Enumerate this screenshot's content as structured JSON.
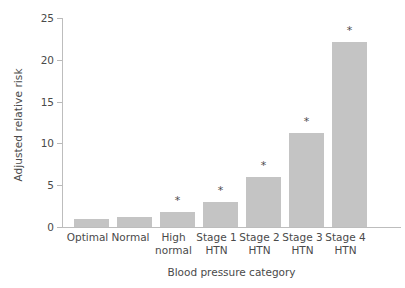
{
  "chart_data": {
    "type": "bar",
    "title": "",
    "subtitle": "",
    "xlabel": "Blood pressure category",
    "ylabel": "Adjusted relative risk",
    "categories": [
      "Optimal",
      "Normal",
      "High normal",
      "Stage 1 HTN",
      "Stage 2 HTN",
      "Stage 3 HTN",
      "Stage 4 HTN"
    ],
    "category_lines": [
      [
        "Optimal"
      ],
      [
        "Normal"
      ],
      [
        "High",
        "normal"
      ],
      [
        "Stage 1",
        "HTN"
      ],
      [
        "Stage 2",
        "HTN"
      ],
      [
        "Stage 3",
        "HTN"
      ],
      [
        "Stage 4",
        "HTN"
      ]
    ],
    "values": [
      1.0,
      1.2,
      1.8,
      3.0,
      6.0,
      11.2,
      22.1
    ],
    "annotations": [
      "",
      "",
      "*",
      "*",
      "*",
      "*",
      "*"
    ],
    "significance_marker": "*",
    "ylim": [
      0,
      25
    ],
    "yticks": [
      0,
      5,
      10,
      15,
      20,
      25
    ],
    "ytick_labels": [
      "0",
      "5",
      "10",
      "15",
      "20",
      "25"
    ],
    "grid": false,
    "legend": "none",
    "bar_color": "#c4c4c4",
    "axis_color": "#bdbdbd",
    "text_color": "#4a4a4a",
    "background": "#ffffff"
  }
}
